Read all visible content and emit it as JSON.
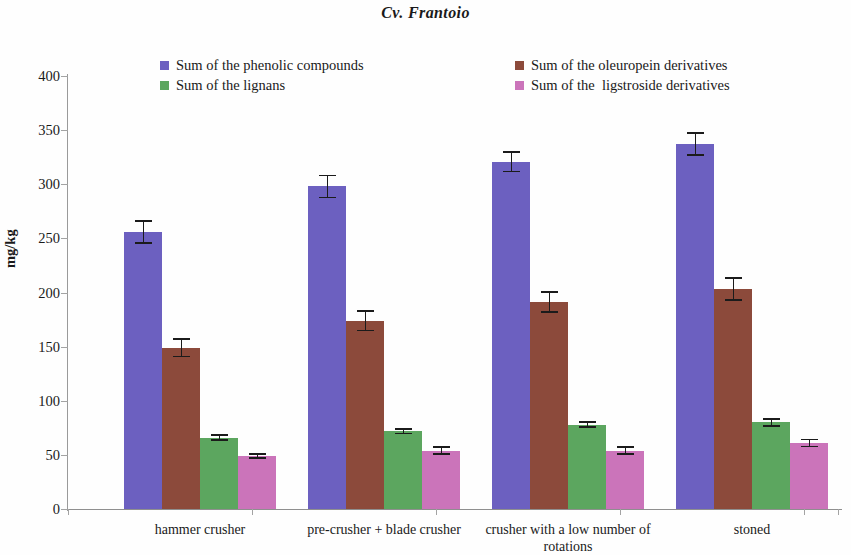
{
  "title": "Cv. Frantoio",
  "axis": {
    "ylabel": "mg/kg",
    "yticks": [
      "0",
      "50",
      "100",
      "150",
      "200",
      "250",
      "300",
      "350",
      "400"
    ]
  },
  "legend": {
    "items": [
      {
        "label": "Sum of the phenolic compounds",
        "color": "#6C60C0",
        "swatch": "legend-swatch-phenolic"
      },
      {
        "label": "Sum of the oleuropein derivatives",
        "color": "#8C4A3B",
        "swatch": "legend-swatch-oleuropein"
      },
      {
        "label": "Sum of the lignans",
        "color": "#5CA65F",
        "swatch": "legend-swatch-lignans"
      },
      {
        "label": "Sum of the  ligstroside derivatives",
        "color": "#CB74BA",
        "swatch": "legend-swatch-ligstroside"
      }
    ]
  },
  "chart_data": {
    "type": "bar",
    "title": "Cv. Frantoio",
    "xlabel": "",
    "ylabel": "mg/kg",
    "ylim": [
      0,
      400
    ],
    "ytick_step": 50,
    "grid": false,
    "legend_position": "top",
    "categories": [
      "hammer crusher",
      "pre-crusher + blade crusher",
      "crusher with a low number of rotations",
      "stoned"
    ],
    "series": [
      {
        "name": "Sum of the phenolic compounds",
        "color": "#6C60C0",
        "values": [
          256,
          298,
          321,
          337
        ],
        "errors": [
          11,
          11,
          10,
          11
        ]
      },
      {
        "name": "Sum of the oleuropein derivatives",
        "color": "#8C4A3B",
        "values": [
          149,
          174,
          191,
          203
        ],
        "errors": [
          9,
          10,
          10,
          11
        ]
      },
      {
        "name": "Sum of the lignans",
        "color": "#5CA65F",
        "values": [
          66,
          72,
          78,
          80
        ],
        "errors": [
          3,
          3,
          3,
          4
        ]
      },
      {
        "name": "Sum of the  ligstroside derivatives",
        "color": "#CB74BA",
        "values": [
          49,
          54,
          54,
          61
        ],
        "errors": [
          3,
          4,
          4,
          4
        ]
      }
    ]
  }
}
